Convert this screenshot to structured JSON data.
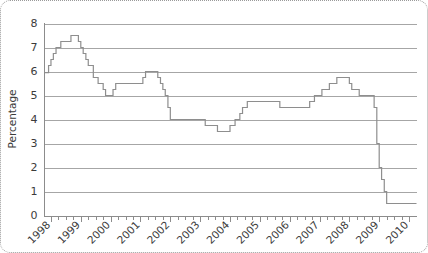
{
  "chart_data": {
    "type": "line",
    "line_style": "step-post",
    "title": "",
    "xlabel": "",
    "ylabel": "Percentage",
    "ylim": [
      0,
      8
    ],
    "xlim": [
      1997.75,
      2010.25
    ],
    "grid": true,
    "legend": false,
    "y_ticks": [
      0,
      1,
      2,
      3,
      4,
      5,
      6,
      7,
      8
    ],
    "y_tick_labels": [
      "0",
      "1",
      "2",
      "3",
      "4",
      "5",
      "6",
      "7",
      "8"
    ],
    "x_ticks": [
      1998,
      1999,
      2000,
      2001,
      2002,
      2003,
      2004,
      2005,
      2006,
      2007,
      2008,
      2009,
      2010
    ],
    "x_tick_labels": [
      "1998",
      "1999",
      "2000",
      "2001",
      "2002",
      "2003",
      "2004",
      "2005",
      "2006",
      "2007",
      "2008",
      "2009",
      "2010"
    ],
    "x_minor_ticks_per_interval": 4,
    "series": [
      {
        "name": "Interest rate",
        "color": "#8e8e8e",
        "x": [
          1997.8,
          1997.92,
          1998.0,
          1998.08,
          1998.17,
          1998.25,
          1998.33,
          1998.5,
          1998.67,
          1998.83,
          1998.92,
          1999.0,
          1999.08,
          1999.17,
          1999.25,
          1999.42,
          1999.58,
          1999.75,
          1999.83,
          2000.0,
          2000.08,
          2000.17,
          2001.08,
          2001.17,
          2001.25,
          2001.33,
          2001.42,
          2001.58,
          2001.67,
          2001.75,
          2001.83,
          2001.92,
          2002.0,
          2003.08,
          2003.17,
          2003.5,
          2003.58,
          2003.92,
          2004.0,
          2004.08,
          2004.17,
          2004.33,
          2004.42,
          2004.58,
          2004.67,
          2005.58,
          2005.67,
          2006.58,
          2006.67,
          2006.83,
          2006.92,
          2007.0,
          2007.08,
          2007.25,
          2007.33,
          2007.5,
          2007.58,
          2007.92,
          2008.0,
          2008.08,
          2008.25,
          2008.33,
          2008.75,
          2008.83,
          2008.92,
          2009.0,
          2009.08,
          2009.17,
          2009.25,
          2009.33,
          2009.42,
          2010.25
        ],
        "values": [
          5.95,
          6.25,
          6.5,
          6.75,
          7.0,
          7.0,
          7.25,
          7.25,
          7.5,
          7.5,
          7.25,
          7.0,
          6.75,
          6.5,
          6.25,
          5.75,
          5.5,
          5.25,
          5.0,
          5.0,
          5.25,
          5.5,
          5.75,
          6.0,
          6.0,
          6.0,
          6.0,
          5.75,
          5.5,
          5.25,
          5.0,
          4.5,
          4.0,
          4.0,
          3.75,
          3.75,
          3.5,
          3.5,
          3.75,
          3.75,
          4.0,
          4.25,
          4.5,
          4.75,
          4.75,
          4.75,
          4.5,
          4.5,
          4.75,
          5.0,
          5.0,
          5.0,
          5.25,
          5.25,
          5.5,
          5.5,
          5.75,
          5.75,
          5.5,
          5.25,
          5.25,
          5.0,
          5.0,
          4.5,
          3.0,
          2.0,
          1.5,
          1.0,
          0.5,
          0.5,
          0.5,
          0.5
        ]
      }
    ],
    "key_points": {
      "start_1998": 5.95,
      "peak_1998": 7.5,
      "trough_1999": 5.0,
      "plateau_2000_2001": 6.0,
      "level_2002": 4.0,
      "trough_2003": 3.5,
      "level_2004_2005": 4.75,
      "level_2006": 4.5,
      "peak_2007": 5.75,
      "crash_2009_floor": 0.5
    }
  },
  "figure": {
    "border_style": "dotted-rounded",
    "border_color": "#9a9a9a",
    "background": "#ffffff",
    "grid_color": "#a6a6a6",
    "axis_color": "#8c8c8c",
    "text_color": "#3b3b3b"
  }
}
